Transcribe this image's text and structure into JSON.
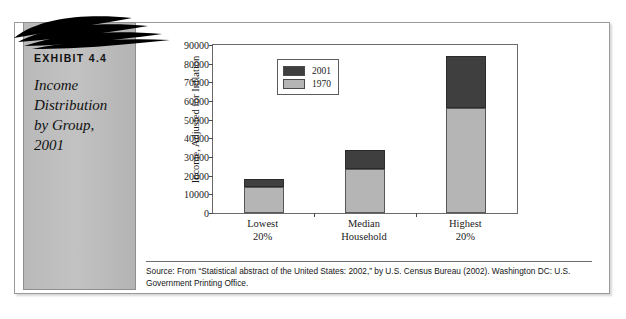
{
  "exhibit": {
    "number_label": "EXHIBIT 4.4",
    "title_lines": [
      "Income",
      "Distribution",
      "by Group,",
      "2001"
    ],
    "title_text": "Income Distribution by Group, 2001",
    "panel_color": "#bdbdbd",
    "swoosh_color": "#000000"
  },
  "source": {
    "text": "Source: From “Statistical abstract of the United States: 2002,” by U.S. Census Bureau (2002). Washington DC: U.S. Government Printing Office."
  },
  "chart_data": {
    "type": "bar",
    "subtype": "stacked-overlay",
    "title": "Income Distribution by Group, 2001",
    "xlabel": "",
    "ylabel": "Income, Adjusted for Inflation",
    "categories": [
      "Lowest\n20%",
      "Median\nHousehold",
      "Highest\n20%"
    ],
    "category_lines": [
      [
        "Lowest",
        "20%"
      ],
      [
        "Median",
        "Household"
      ],
      [
        "Highest",
        "20%"
      ]
    ],
    "series": [
      {
        "name": "2001",
        "color": "#3f3f3f",
        "values": [
          18000,
          34000,
          84000
        ]
      },
      {
        "name": "1970",
        "color": "#b5b5b5",
        "values": [
          14000,
          23500,
          56500
        ]
      }
    ],
    "ylim": [
      0,
      90000
    ],
    "ytick_step": 10000,
    "yticks": [
      0,
      10000,
      20000,
      30000,
      40000,
      50000,
      60000,
      70000,
      80000,
      90000
    ],
    "ytick_labels": [
      "0",
      "10000",
      "20000",
      "30000",
      "40000",
      "50000",
      "60000",
      "70000",
      "80000",
      "90000"
    ],
    "grid": false,
    "legend_position": "upper-left-inside",
    "legend_entries": [
      "2001",
      "1970"
    ]
  }
}
